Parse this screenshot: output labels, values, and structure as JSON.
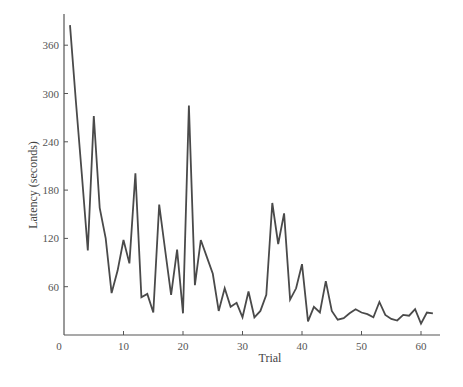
{
  "chart_data": {
    "type": "line",
    "title": "",
    "xlabel": "Trial",
    "ylabel": "Latency (seconds)",
    "xlim": [
      0,
      63
    ],
    "ylim": [
      0,
      390
    ],
    "grid": false,
    "legend": null,
    "x_ticks": [
      0,
      10,
      20,
      30,
      40,
      50,
      60
    ],
    "y_ticks": [
      60,
      120,
      180,
      240,
      300,
      360
    ],
    "x_tick_labels": [
      "0",
      "10",
      "20",
      "30",
      "40",
      "50",
      "60"
    ],
    "y_tick_labels": [
      "60",
      "120",
      "180",
      "240",
      "300",
      "360"
    ],
    "series": [
      {
        "name": "Latency",
        "color": "#4a4a4a",
        "x": [
          1,
          2,
          3,
          4,
          5,
          6,
          7,
          8,
          9,
          10,
          11,
          12,
          13,
          14,
          15,
          16,
          17,
          18,
          19,
          20,
          21,
          22,
          23,
          24,
          25,
          26,
          27,
          28,
          29,
          30,
          31,
          32,
          33,
          34,
          35,
          36,
          37,
          38,
          39,
          40,
          41,
          42,
          43,
          44,
          45,
          46,
          47,
          48,
          49,
          50,
          51,
          52,
          53,
          54,
          55,
          56,
          57,
          58,
          59,
          60,
          61,
          62
        ],
        "values": [
          385,
          290,
          200,
          105,
          272,
          158,
          120,
          52,
          80,
          118,
          89,
          201,
          47,
          51,
          28,
          162,
          105,
          50,
          106,
          27,
          285,
          62,
          118,
          97,
          76,
          30,
          58,
          35,
          40,
          22,
          54,
          22,
          30,
          50,
          164,
          113,
          151,
          44,
          58,
          88,
          17,
          35,
          28,
          67,
          30,
          19,
          21,
          27,
          32,
          28,
          26,
          22,
          41,
          25,
          20,
          18,
          25,
          24,
          32,
          14,
          28,
          27
        ]
      }
    ]
  }
}
